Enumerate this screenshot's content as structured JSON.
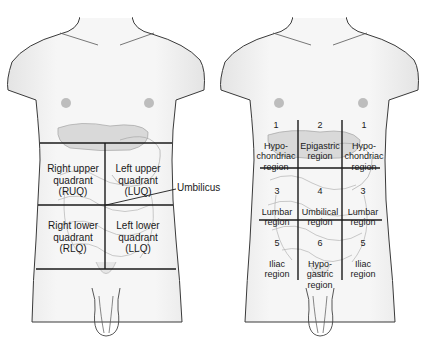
{
  "figures": {
    "quadrants": {
      "labels": [
        {
          "id": "ruq",
          "text": "Right upper\nquadrant\n(RUQ)"
        },
        {
          "id": "luq",
          "text": "Left upper\nquadrant\n(LUQ)"
        },
        {
          "id": "rlq",
          "text": "Right lower\nquadrant\n(RLQ)"
        },
        {
          "id": "llq",
          "text": "Left lower\nquadrant\n(LLQ)"
        }
      ],
      "callout": "Umbilicus"
    },
    "regions": {
      "labels": [
        {
          "id": "r-hypochondriac",
          "number": "1",
          "text": "Hypo-\nchondriac\nregion"
        },
        {
          "id": "epigastric",
          "number": "2",
          "text": "Epigastric\nregion"
        },
        {
          "id": "l-hypochondriac",
          "number": "1",
          "text": "Hypo-\nchondriac\nregion"
        },
        {
          "id": "r-lumbar",
          "number": "3",
          "text": "Lumbar\nregion"
        },
        {
          "id": "umbilical",
          "number": "4",
          "text": "Umbilical\nregion"
        },
        {
          "id": "l-lumbar",
          "number": "3",
          "text": "Lumbar\nregion"
        },
        {
          "id": "r-iliac",
          "number": "5",
          "text": "Iliac\nregion"
        },
        {
          "id": "hypogastric",
          "number": "6",
          "text": "Hypo-\ngastric\nregion"
        },
        {
          "id": "l-iliac",
          "number": "5",
          "text": "Iliac\nregion"
        }
      ]
    }
  },
  "colors": {
    "body_fill": "#f2f2f2",
    "outline": "#3a3a3a",
    "organ": "#c9c9c9",
    "nipple": "#bdbdbd",
    "grid_line": "#1a1a1a"
  }
}
